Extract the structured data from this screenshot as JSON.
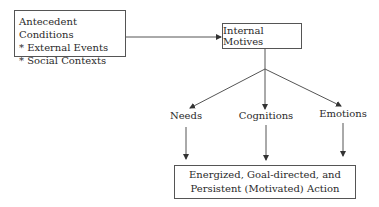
{
  "diagram": {
    "antecedent": {
      "title": "Antecedent Conditions",
      "items": [
        "* External Events",
        "* Social Contexts"
      ]
    },
    "internal_motives": {
      "label": "Internal Motives"
    },
    "branches": [
      {
        "label": "Needs"
      },
      {
        "label": "Cognitions"
      },
      {
        "label": "Emotions"
      }
    ],
    "outcome": {
      "line1": "Energized, Goal-directed, and",
      "line2": "Persistent (Motivated) Action"
    }
  }
}
